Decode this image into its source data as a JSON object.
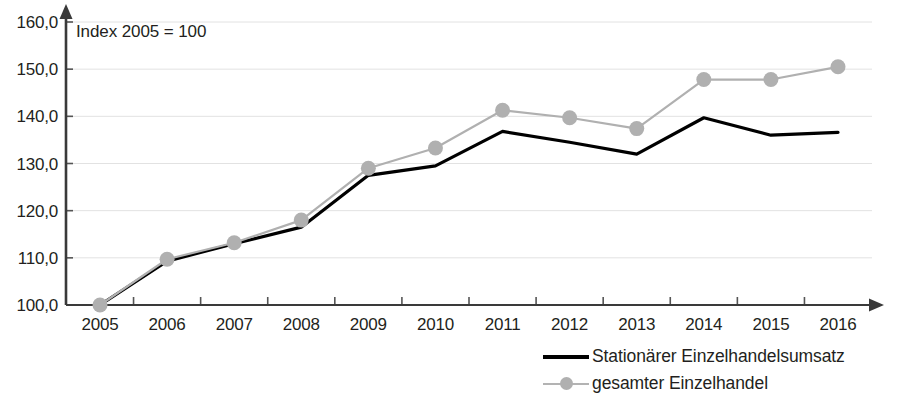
{
  "chart_data": {
    "type": "line",
    "title": "",
    "annotation": "Index 2005 = 100",
    "xlabel": "",
    "ylabel": "",
    "categories": [
      "2005",
      "2006",
      "2007",
      "2008",
      "2009",
      "2010",
      "2011",
      "2012",
      "2013",
      "2014",
      "2015",
      "2016"
    ],
    "ylim": [
      100.0,
      160.0
    ],
    "yticks": [
      "100,0",
      "110,0",
      "120,0",
      "130,0",
      "140,0",
      "150,0",
      "160,0"
    ],
    "ytick_values": [
      100.0,
      110.0,
      120.0,
      130.0,
      140.0,
      150.0,
      160.0
    ],
    "grid": true,
    "legend_position": "bottom-right",
    "series": [
      {
        "name": "Stationärer Einzelhandelsumsatz",
        "color": "#000000",
        "marker": "none",
        "values": [
          100.0,
          109.3,
          113.0,
          116.5,
          127.5,
          129.5,
          136.8,
          134.5,
          132.0,
          139.7,
          136.0,
          136.6
        ]
      },
      {
        "name": "gesamter Einzelhandel",
        "color": "#b0b0b0",
        "marker": "circle",
        "values": [
          100.0,
          109.7,
          113.2,
          118.0,
          129.0,
          133.3,
          141.3,
          139.7,
          137.4,
          147.8,
          147.8,
          150.5
        ]
      }
    ]
  },
  "legend": {
    "items": [
      {
        "label": "Stationärer Einzelhandelsumsatz",
        "style": "solid"
      },
      {
        "label": "gesamter Einzelhandel",
        "style": "marker"
      }
    ]
  }
}
